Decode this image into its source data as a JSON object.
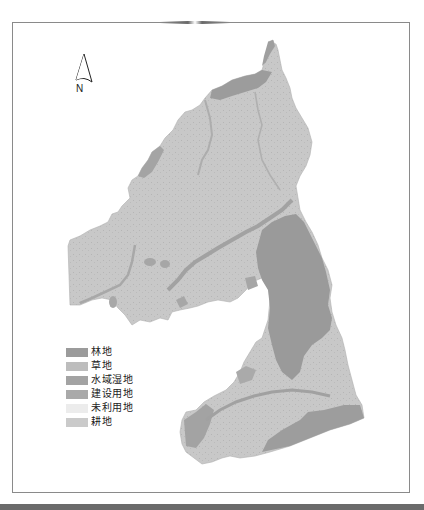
{
  "map": {
    "north_arrow": {
      "icon": "north-arrow-icon",
      "label": "N"
    },
    "colors": {
      "background": "#ffffff",
      "frame": "#8a8a8a",
      "base_farmland": "#c9c9c9",
      "forest": "#9a9a9a",
      "water": "#a6a6a6"
    },
    "legend": [
      {
        "label": "林地",
        "color": "#9b9b9b"
      },
      {
        "label": "草地",
        "color": "#bdbdbd"
      },
      {
        "label": "水域湿地",
        "color": "#a3a3a3"
      },
      {
        "label": "建设用地",
        "color": "#a9a9a9"
      },
      {
        "label": "未利用地",
        "color": "#ececec"
      },
      {
        "label": "耕地",
        "color": "#cacaca"
      }
    ]
  }
}
